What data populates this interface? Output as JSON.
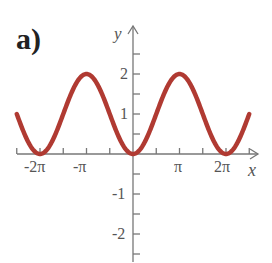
{
  "part_label": "a)",
  "chart_data": {
    "type": "line",
    "title": "",
    "function": "y = 1 - cos(x)",
    "xlabel": "x",
    "ylabel": "y",
    "xlim": [
      -7.85,
      7.85
    ],
    "ylim": [
      -2.6,
      2.6
    ],
    "x_ticks": [
      "-2π",
      "-π",
      "π",
      "2π"
    ],
    "y_ticks": [
      "2",
      "1",
      "-1",
      "-2"
    ],
    "series": [
      {
        "name": "y=1-cos x",
        "color": "#b03a32",
        "x": [
          "-5π/2",
          "-2π",
          "-3π/2",
          "-π",
          "-π/2",
          "0",
          "π/2",
          "π",
          "3π/2",
          "2π",
          "5π/2"
        ],
        "values": [
          1,
          0,
          1,
          2,
          1,
          0,
          1,
          2,
          1,
          0,
          1
        ]
      }
    ],
    "grid": false
  }
}
